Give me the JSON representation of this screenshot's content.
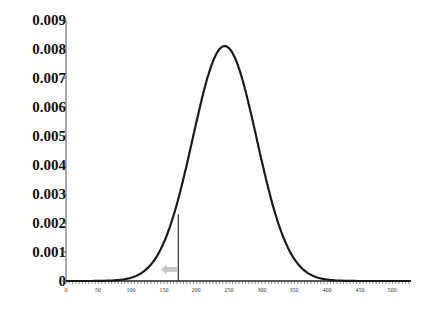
{
  "chart_data": {
    "type": "line",
    "title": "",
    "xlabel": "",
    "ylabel": "",
    "xlim": [
      0,
      528
    ],
    "ylim": [
      0,
      0.009
    ],
    "grid": false,
    "legend": null,
    "x_ticks": [
      "0",
      "50",
      "100",
      "150",
      "200",
      "250",
      "300",
      "350",
      "400",
      "450",
      "500"
    ],
    "y_ticks": [
      "0",
      "0.001",
      "0.002",
      "0.003",
      "0.004",
      "0.005",
      "0.006",
      "0.007",
      "0.008",
      "0.009"
    ],
    "series": [
      {
        "name": "density",
        "distribution": "normal",
        "mean": 243,
        "sd": 49,
        "peak": 0.0081,
        "x": [
          0,
          50,
          100,
          125,
          150,
          175,
          200,
          225,
          243,
          260,
          275,
          300,
          325,
          350,
          375,
          400,
          450,
          500,
          528
        ],
        "y": [
          0,
          0,
          1e-05,
          0.0004,
          0.00135,
          0.0031,
          0.0055,
          0.0075,
          0.0081,
          0.0077,
          0.0066,
          0.0043,
          0.002,
          0.00075,
          0.0002,
          5e-05,
          0,
          0,
          0
        ]
      }
    ],
    "annotations": [
      {
        "type": "vertical-line",
        "x": 172,
        "y_top": 0.0023,
        "color": "#333333"
      },
      {
        "type": "arrow",
        "direction": "left",
        "x_from": 170,
        "x_to": 145,
        "y": 0.0004,
        "color": "#c8c8c8"
      }
    ]
  },
  "colors": {
    "curve": "#1a1a1a",
    "axis": "#555555",
    "marker_line": "#333333",
    "arrow": "#c8c8c8"
  }
}
